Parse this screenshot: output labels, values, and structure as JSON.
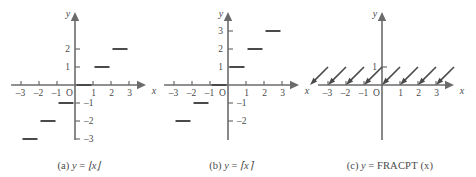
{
  "figure": {
    "colors": {
      "axis": "#6b6b6b",
      "curve": "#4a4a4a",
      "text": "#4a4a4a",
      "background": "#ffffff"
    }
  },
  "panels": [
    {
      "id": "a",
      "caption_label": "(a)",
      "caption_lhs": "y",
      "caption_eq": "=",
      "caption_rhs": "⌊x⌋",
      "axis_x_label": "x",
      "axis_y_label": "y",
      "origin_label": "O",
      "x_ticks": [
        "–3",
        "–2",
        "–1",
        "1",
        "2",
        "3"
      ],
      "y_ticks": [
        "2",
        "1",
        "–1",
        "–2",
        "–3"
      ],
      "chart_data": {
        "type": "line",
        "title": "y = floor(x)",
        "xlabel": "x",
        "ylabel": "y",
        "xlim": [
          -3.6,
          3.6
        ],
        "ylim": [
          -3.6,
          2.8
        ],
        "grid": false,
        "legend": "none",
        "segments": [
          {
            "x0": -3,
            "x1": -2,
            "y": -3
          },
          {
            "x0": -2,
            "x1": -1,
            "y": -2
          },
          {
            "x0": -1,
            "x1": 0,
            "y": -1
          },
          {
            "x0": 0,
            "x1": 1,
            "y": 0
          },
          {
            "x0": 1,
            "x1": 2,
            "y": 1
          },
          {
            "x0": 2,
            "x1": 3,
            "y": 2
          }
        ]
      }
    },
    {
      "id": "b",
      "caption_label": "(b)",
      "caption_lhs": "y",
      "caption_eq": "=",
      "caption_rhs": "⌈x⌉",
      "axis_x_label": "x",
      "axis_y_label": "y",
      "origin_label": "O",
      "x_ticks": [
        "–3",
        "–2",
        "–1",
        "1",
        "2",
        "3"
      ],
      "y_ticks": [
        "3",
        "2",
        "1",
        "–1",
        "–2"
      ],
      "chart_data": {
        "type": "line",
        "title": "y = ceiling(x)",
        "xlabel": "x",
        "ylabel": "y",
        "xlim": [
          -3.6,
          3.6
        ],
        "ylim": [
          -3.0,
          3.6
        ],
        "grid": false,
        "legend": "none",
        "segments": [
          {
            "x0": -3,
            "x1": -2,
            "y": -2
          },
          {
            "x0": -2,
            "x1": -1,
            "y": -1
          },
          {
            "x0": -1,
            "x1": 0,
            "y": 0
          },
          {
            "x0": 0,
            "x1": 1,
            "y": 1
          },
          {
            "x0": 1,
            "x1": 2,
            "y": 2
          },
          {
            "x0": 2,
            "x1": 3,
            "y": 3
          }
        ]
      }
    },
    {
      "id": "c",
      "caption_label": "(c)",
      "caption_lhs": "y",
      "caption_eq": "=",
      "caption_rhs": "FRACPT (x)",
      "axis_x_label": "x",
      "axis_y_label": "y",
      "origin_label": "O",
      "x_ticks": [
        "–3",
        "–2",
        "–1",
        "1",
        "2",
        "3"
      ],
      "y_ticks": [
        "1"
      ],
      "chart_data": {
        "type": "line",
        "title": "y = FRACPT(x)",
        "xlabel": "x",
        "ylabel": "y",
        "xlim": [
          -3.6,
          3.6
        ],
        "ylim": [
          -0.6,
          1.8
        ],
        "grid": false,
        "legend": "none",
        "ramps": [
          {
            "x0": -4,
            "x1": -3,
            "y0": 0,
            "y1": 1
          },
          {
            "x0": -3,
            "x1": -2,
            "y0": 0,
            "y1": 1
          },
          {
            "x0": -2,
            "x1": -1,
            "y0": 0,
            "y1": 1
          },
          {
            "x0": -1,
            "x1": 0,
            "y0": 0,
            "y1": 1
          },
          {
            "x0": 0,
            "x1": 1,
            "y0": 0,
            "y1": 1
          },
          {
            "x0": 1,
            "x1": 2,
            "y0": 0,
            "y1": 1
          },
          {
            "x0": 2,
            "x1": 3,
            "y0": 0,
            "y1": 1
          },
          {
            "x0": 3,
            "x1": 4,
            "y0": 0,
            "y1": 1
          }
        ],
        "arrow_at": "start-of-each-ramp"
      }
    }
  ]
}
